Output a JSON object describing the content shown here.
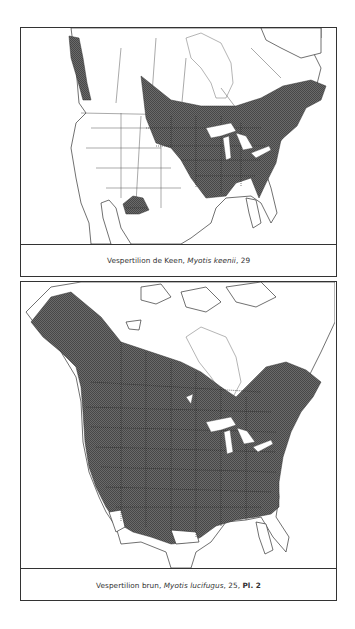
{
  "figures": [
    {
      "id": "keen",
      "caption": {
        "common_name": "Vespertilion de Keen, ",
        "scientific_name": "Myotis keenii",
        "suffix": ", 29",
        "plate": ""
      },
      "map": {
        "subject": "Distribution range of Keen's myotis in North America",
        "range_color": "#555555"
      }
    },
    {
      "id": "brun",
      "caption": {
        "common_name": "Vespertilion brun, ",
        "scientific_name": "Myotis lucifugus",
        "suffix": ", 25, ",
        "plate": "Pl. 2"
      },
      "map": {
        "subject": "Distribution range of little brown myotis in North America",
        "range_color": "#555555"
      }
    }
  ]
}
